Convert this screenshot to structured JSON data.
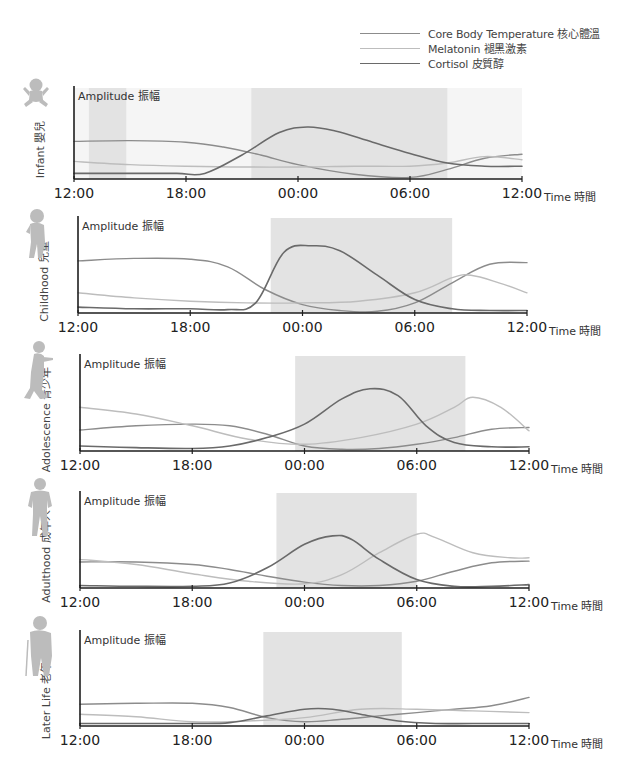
{
  "legend": {
    "items": [
      {
        "label": "Core Body Temperature 核心體溫",
        "color": "#8c8c8c",
        "width": 1.4
      },
      {
        "label": "Melatonin 褪黑激素",
        "color": "#bdbdbd",
        "width": 1.4
      },
      {
        "label": "Cortisol 皮質醇",
        "color": "#6a6a6a",
        "width": 1.6
      }
    ]
  },
  "chart_data": {
    "type": "line",
    "title": "",
    "xlabel": "Time 時間",
    "ylabel": "Amplitude 振幅",
    "x_ticks": [
      "12:00",
      "18:00",
      "00:00",
      "06:00",
      "12:00"
    ],
    "x_hours": [
      12,
      18,
      24,
      30,
      36
    ],
    "grid": false,
    "legend_position": "top-right",
    "y_scale": "relative amplitude 0-1 (unlabeled)",
    "panels": [
      {
        "name": "Infant 嬰兒",
        "icon": "infant-figure-icon",
        "sleep_shading": [
          [
            12.8,
            14.8
          ],
          [
            21.5,
            32.0
          ]
        ],
        "faint_background": true,
        "series": [
          {
            "name": "Core Body Temperature",
            "x": [
              12,
              15,
              18,
              20,
              22,
              24,
              27,
              30,
              32,
              34,
              36
            ],
            "y": [
              0.47,
              0.48,
              0.46,
              0.4,
              0.3,
              0.18,
              0.06,
              0.02,
              0.12,
              0.26,
              0.31
            ]
          },
          {
            "name": "Melatonin",
            "x": [
              12,
              15,
              18,
              21,
              24,
              27,
              30,
              32,
              34,
              36
            ],
            "y": [
              0.22,
              0.18,
              0.16,
              0.15,
              0.15,
              0.16,
              0.16,
              0.2,
              0.28,
              0.24
            ]
          },
          {
            "name": "Cortisol",
            "x": [
              12,
              15,
              17.5,
              19,
              21,
              23,
              24.5,
              26,
              28,
              30,
              32,
              34,
              36
            ],
            "y": [
              0.07,
              0.07,
              0.07,
              0.07,
              0.3,
              0.58,
              0.65,
              0.6,
              0.46,
              0.32,
              0.2,
              0.16,
              0.16
            ]
          }
        ]
      },
      {
        "name": "Childhood 兒童",
        "icon": "child-figure-icon",
        "sleep_shading": [
          [
            22.3,
            32.0
          ]
        ],
        "series": [
          {
            "name": "Core Body Temperature",
            "x": [
              12,
              15,
              18,
              20,
              22,
              24,
              26,
              28,
              30,
              32,
              34,
              36
            ],
            "y": [
              0.62,
              0.65,
              0.64,
              0.55,
              0.28,
              0.1,
              0.03,
              0.02,
              0.12,
              0.36,
              0.58,
              0.6
            ]
          },
          {
            "name": "Melatonin",
            "x": [
              12,
              15,
              18,
              21,
              24,
              27,
              30,
              32,
              33,
              34.5,
              36
            ],
            "y": [
              0.24,
              0.18,
              0.14,
              0.12,
              0.12,
              0.14,
              0.24,
              0.42,
              0.45,
              0.36,
              0.24
            ]
          },
          {
            "name": "Cortisol",
            "x": [
              12,
              15,
              18,
              20,
              21.5,
              23,
              24.5,
              26,
              28,
              30,
              32,
              34,
              36
            ],
            "y": [
              0.07,
              0.05,
              0.05,
              0.04,
              0.12,
              0.72,
              0.8,
              0.74,
              0.45,
              0.16,
              0.05,
              0.03,
              0.03
            ]
          }
        ]
      },
      {
        "name": "Adolescence 青少年",
        "icon": "adolescent-figure-icon",
        "sleep_shading": [
          [
            23.5,
            32.6
          ]
        ],
        "series": [
          {
            "name": "Core Body Temperature",
            "x": [
              12,
              15,
              18,
              20,
              22,
              24,
              26,
              28,
              30,
              32,
              34,
              36
            ],
            "y": [
              0.25,
              0.3,
              0.32,
              0.3,
              0.2,
              0.06,
              0.02,
              0.03,
              0.08,
              0.16,
              0.26,
              0.28
            ]
          },
          {
            "name": "Melatonin",
            "x": [
              12,
              15,
              18,
              21,
              24,
              27,
              30,
              32,
              33,
              34.5,
              36
            ],
            "y": [
              0.52,
              0.44,
              0.3,
              0.14,
              0.08,
              0.16,
              0.32,
              0.52,
              0.64,
              0.52,
              0.24
            ]
          },
          {
            "name": "Cortisol",
            "x": [
              12,
              15,
              18,
              20,
              22,
              24,
              26,
              27.5,
              29,
              30.5,
              32,
              34,
              36
            ],
            "y": [
              0.06,
              0.04,
              0.03,
              0.06,
              0.16,
              0.32,
              0.62,
              0.74,
              0.66,
              0.3,
              0.1,
              0.05,
              0.05
            ]
          }
        ]
      },
      {
        "name": "Adulthood 成年人",
        "icon": "adult-figure-icon",
        "sleep_shading": [
          [
            22.5,
            30.0
          ]
        ],
        "series": [
          {
            "name": "Core Body Temperature",
            "x": [
              12,
              15,
              18,
              20,
              22,
              24,
              26,
              28,
              30,
              32,
              34,
              36
            ],
            "y": [
              0.31,
              0.31,
              0.28,
              0.22,
              0.14,
              0.07,
              0.03,
              0.03,
              0.08,
              0.2,
              0.3,
              0.32
            ]
          },
          {
            "name": "Melatonin",
            "x": [
              12,
              15,
              18,
              21,
              24,
              26,
              28,
              30,
              31,
              33,
              35,
              36
            ],
            "y": [
              0.34,
              0.28,
              0.17,
              0.08,
              0.05,
              0.16,
              0.42,
              0.64,
              0.6,
              0.42,
              0.36,
              0.36
            ]
          },
          {
            "name": "Cortisol",
            "x": [
              12,
              15,
              18,
              20,
              22,
              24,
              25.5,
              26.5,
              28,
              30,
              32,
              34,
              36
            ],
            "y": [
              0.03,
              0.02,
              0.02,
              0.06,
              0.24,
              0.52,
              0.62,
              0.58,
              0.34,
              0.1,
              0.02,
              0.02,
              0.04
            ]
          }
        ]
      },
      {
        "name": "Later Life 老年人",
        "icon": "elderly-figure-icon",
        "sleep_shading": [
          [
            21.8,
            29.2
          ]
        ],
        "series": [
          {
            "name": "Core Body Temperature",
            "x": [
              12,
              15,
              18,
              20,
              22,
              24,
              26,
              28,
              30,
              32,
              34,
              36
            ],
            "y": [
              0.26,
              0.27,
              0.27,
              0.22,
              0.1,
              0.05,
              0.08,
              0.12,
              0.16,
              0.2,
              0.24,
              0.34
            ]
          },
          {
            "name": "Melatonin",
            "x": [
              12,
              15,
              18,
              21,
              24,
              27,
              30,
              33,
              36
            ],
            "y": [
              0.14,
              0.11,
              0.05,
              0.06,
              0.1,
              0.2,
              0.2,
              0.18,
              0.16
            ]
          },
          {
            "name": "Cortisol",
            "x": [
              12,
              15,
              18,
              20,
              22,
              24,
              25.5,
              27,
              29,
              31,
              33,
              36
            ],
            "y": [
              0.03,
              0.03,
              0.03,
              0.04,
              0.12,
              0.2,
              0.2,
              0.14,
              0.06,
              0.03,
              0.03,
              0.03
            ]
          }
        ]
      }
    ]
  },
  "panels": [
    {
      "label": "Infant 嬰兒",
      "amplitude_label": "Amplitude 振幅",
      "time_label": "Time 時間",
      "ticks": [
        "12:00",
        "18:00",
        "00:00",
        "06:00",
        "12:00"
      ]
    },
    {
      "label": "Childhood 兒童",
      "amplitude_label": "Amplitude 振幅",
      "time_label": "Time 時間",
      "ticks": [
        "12:00",
        "18:00",
        "00:00",
        "06:00",
        "12:00"
      ]
    },
    {
      "label": "Adolescence 青少年",
      "amplitude_label": "Amplitude 振幅",
      "time_label": "Time 時間",
      "ticks": [
        "12:00",
        "18:00",
        "00:00",
        "06:00",
        "12:00"
      ]
    },
    {
      "label": "Adulthood 成年人",
      "amplitude_label": "Amplitude 振幅",
      "time_label": "Time 時間",
      "ticks": [
        "12:00",
        "18:00",
        "00:00",
        "06:00",
        "12:00"
      ]
    },
    {
      "label": "Later Life 老年人",
      "amplitude_label": "Amplitude 振幅",
      "time_label": "Time 時間",
      "ticks": [
        "12:00",
        "18:00",
        "00:00",
        "06:00",
        "12:00"
      ]
    }
  ],
  "colors": {
    "axis": "#1e1e1e",
    "sleep_shade": "#e3e3e3",
    "faint_shade": "#f5f5f5",
    "figure": "#bcbcbc",
    "core_body_temperature": "#8c8c8c",
    "melatonin": "#bdbdbd",
    "cortisol": "#6a6a6a"
  }
}
